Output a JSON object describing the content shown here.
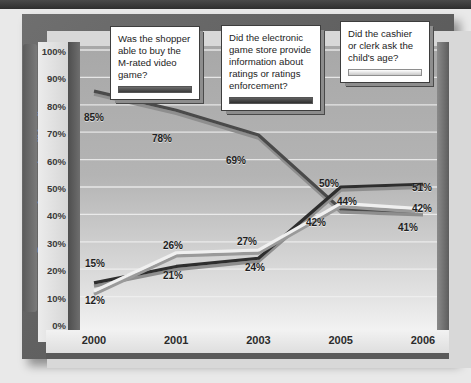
{
  "header": {
    "clipped_bar_text": ""
  },
  "chart_data": {
    "type": "line",
    "title": "",
    "xlabel": "",
    "ylabel": "Percent Answering \"Yes\"",
    "categories": [
      "2000",
      "2001",
      "2003",
      "2005",
      "2006"
    ],
    "ylim": [
      0,
      100
    ],
    "ytick_labels": [
      "100%",
      "90%",
      "80%",
      "70%",
      "60%",
      "50%",
      "40%",
      "30%",
      "20%",
      "10%",
      "0%"
    ],
    "ytick_values": [
      100,
      90,
      80,
      70,
      60,
      50,
      40,
      30,
      20,
      10,
      0
    ],
    "grid": true,
    "legend_position": "callout-boxes-top",
    "series": [
      {
        "name": "Was the shopper able to buy the M-rated video game?",
        "color": "#4a4a4a",
        "values": [
          85,
          78,
          69,
          42,
          41
        ],
        "labels": [
          "85%",
          "78%",
          "69%",
          "42%",
          "41%"
        ]
      },
      {
        "name": "Did the electronic game store provide information about ratings or ratings enforcement?",
        "color": "#2e2e2e",
        "values": [
          15,
          21,
          24,
          50,
          51
        ],
        "labels": [
          "15%",
          "21%",
          "24%",
          "50%",
          "51%"
        ]
      },
      {
        "name": "Did the cashier or clerk ask the child's age?",
        "color": "#f0f0f0",
        "values": [
          12,
          26,
          27,
          44,
          42
        ],
        "labels": [
          "12%",
          "26%",
          "27%",
          "44%",
          "42%"
        ]
      }
    ]
  },
  "callouts": [
    {
      "id": "callout-shopper",
      "text": "Was the shopper able to buy the M-rated video game?"
    },
    {
      "id": "callout-store",
      "text": "Did the electronic game store provide information about ratings or ratings enforcement?"
    },
    {
      "id": "callout-cashier",
      "text": "Did the cashier or clerk ask the child's age?"
    }
  ],
  "point_labels": {
    "l85": "85%",
    "l78": "78%",
    "l69": "69%",
    "l42a": "42%",
    "l41": "41%",
    "l15": "15%",
    "l21": "21%",
    "l24": "24%",
    "l50": "50%",
    "l51": "51%",
    "l12": "12%",
    "l26": "26%",
    "l27": "27%",
    "l44": "44%",
    "l42b": "42%"
  }
}
